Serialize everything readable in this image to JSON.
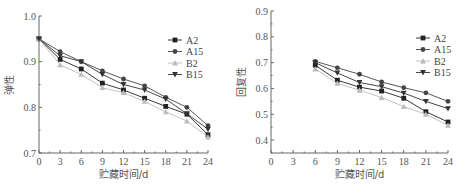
{
  "chart_data": [
    {
      "type": "line",
      "title": "",
      "xlabel": "贮藏时间/d",
      "ylabel": "弹性",
      "xlim": [
        0,
        24
      ],
      "ylim": [
        0.7,
        1.0
      ],
      "xticks": [
        "0",
        "3",
        "6",
        "9",
        "12",
        "15",
        "18",
        "21",
        "24"
      ],
      "yticks": [
        "0.7",
        "0.8",
        "0.9",
        "1.0"
      ],
      "grid": false,
      "legend_position": "upper right",
      "x": [
        0,
        3,
        6,
        9,
        12,
        15,
        18,
        21,
        24
      ],
      "series": [
        {
          "name": "A2",
          "marker": "square",
          "color": "#222222",
          "values": [
            0.95,
            0.905,
            0.884,
            0.853,
            0.838,
            0.82,
            0.802,
            0.785,
            0.74
          ]
        },
        {
          "name": "A15",
          "marker": "circle",
          "color": "#444444",
          "values": [
            0.95,
            0.922,
            0.9,
            0.88,
            0.862,
            0.847,
            0.822,
            0.8,
            0.76
          ]
        },
        {
          "name": "B2",
          "marker": "triangle-up",
          "color": "#bbbbbb",
          "values": [
            0.95,
            0.893,
            0.872,
            0.843,
            0.832,
            0.813,
            0.79,
            0.77,
            0.735
          ]
        },
        {
          "name": "B15",
          "marker": "triangle-down",
          "color": "#333333",
          "values": [
            0.95,
            0.913,
            0.9,
            0.872,
            0.85,
            0.838,
            0.818,
            0.786,
            0.752
          ]
        }
      ]
    },
    {
      "type": "line",
      "title": "",
      "xlabel": "贮藏时间/d",
      "ylabel": "回复性",
      "xlim": [
        0,
        24
      ],
      "ylim": [
        0.35,
        0.9
      ],
      "xticks": [
        "0",
        "3",
        "6",
        "9",
        "12",
        "15",
        "18",
        "21",
        "24"
      ],
      "yticks": [
        "0.4",
        "0.5",
        "0.6",
        "0.7",
        "0.8",
        "0.9"
      ],
      "grid": false,
      "legend_position": "upper right",
      "x": [
        6,
        9,
        12,
        15,
        18,
        21,
        24
      ],
      "series": [
        {
          "name": "A2",
          "marker": "square",
          "color": "#222222",
          "values": [
            0.69,
            0.632,
            0.605,
            0.59,
            0.562,
            0.51,
            0.47
          ]
        },
        {
          "name": "A15",
          "marker": "circle",
          "color": "#444444",
          "values": [
            0.705,
            0.68,
            0.655,
            0.625,
            0.603,
            0.583,
            0.55
          ]
        },
        {
          "name": "B2",
          "marker": "triangle-up",
          "color": "#bbbbbb",
          "values": [
            0.675,
            0.62,
            0.593,
            0.565,
            0.53,
            0.5,
            0.457
          ]
        },
        {
          "name": "B15",
          "marker": "triangle-down",
          "color": "#333333",
          "values": [
            0.7,
            0.66,
            0.623,
            0.607,
            0.582,
            0.55,
            0.522
          ]
        }
      ]
    }
  ],
  "layout": [
    {
      "x0": 39,
      "x1": 208,
      "y_top": 16,
      "y_bottom": 153,
      "legend_x": 168,
      "legend_y": 40
    },
    {
      "x0": 271,
      "x1": 448,
      "y_top": 11,
      "y_bottom": 153,
      "legend_x": 416,
      "legend_y": 38
    }
  ]
}
